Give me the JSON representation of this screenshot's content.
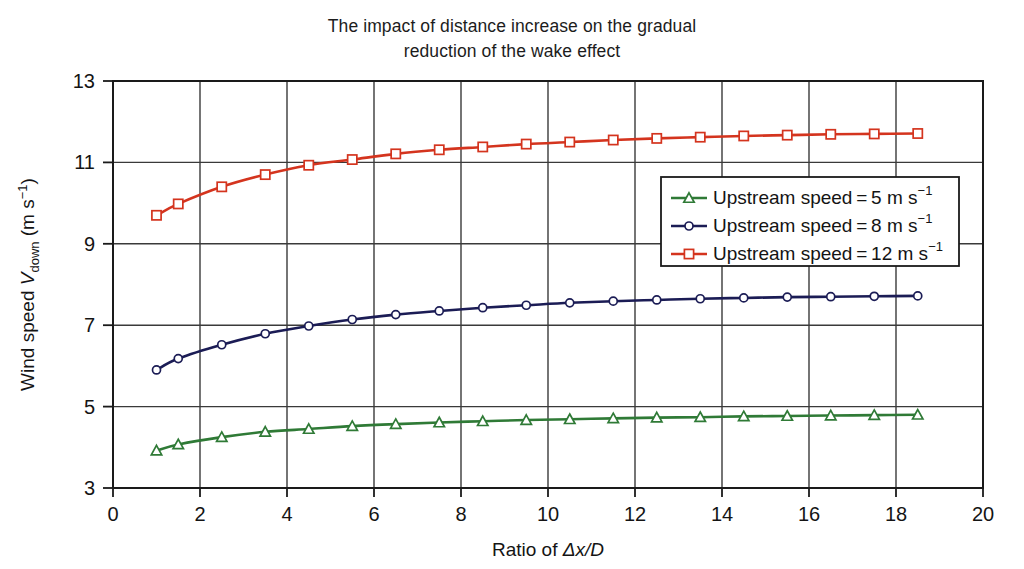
{
  "title": {
    "line1": "The impact of distance increase on the gradual",
    "line2": "reduction of the wake effect"
  },
  "axes": {
    "x_label_prefix": "Ratio of ",
    "x_label_symbol": "Δx/D",
    "y_label_prefix": "Wind speed ",
    "y_label_symbol": "V",
    "y_label_subscript": "down",
    "y_label_units_open": " (m s",
    "y_label_units_sup": "−1",
    "y_label_units_close": ")",
    "x_ticks": [
      "0",
      "2",
      "4",
      "6",
      "8",
      "10",
      "12",
      "14",
      "16",
      "18",
      "20"
    ],
    "y_ticks": [
      "3",
      "5",
      "7",
      "9",
      "11",
      "13"
    ]
  },
  "legend": {
    "position": "inside-right",
    "entries": [
      {
        "label": "Upstream speed = 5 m s",
        "sup": "−1",
        "color": "#2f7a36",
        "marker": "triangle"
      },
      {
        "label": "Upstream speed = 8 m s",
        "sup": "−1",
        "color": "#1b1c55",
        "marker": "diamond"
      },
      {
        "label": "Upstream speed = 12 m s",
        "sup": "−1",
        "color": "#d4341e",
        "marker": "square"
      }
    ]
  },
  "colors": {
    "series_5": "#2f7a36",
    "series_8": "#1b1c55",
    "series_12": "#d4341e",
    "grid": "#3a3a3a",
    "axis": "#1a1a1a",
    "background": "#ffffff"
  },
  "chart_data": {
    "type": "line",
    "title": "The impact of distance increase on the gradual reduction of the wake effect",
    "xlabel": "Ratio of Δx/D",
    "ylabel": "Wind speed V_down (m s−1)",
    "xlim": [
      0,
      20
    ],
    "ylim": [
      3,
      13
    ],
    "xticks": [
      0,
      2,
      4,
      6,
      8,
      10,
      12,
      14,
      16,
      18,
      20
    ],
    "yticks": [
      3,
      5,
      7,
      9,
      11,
      13
    ],
    "grid": true,
    "legend_position": "center right",
    "x": [
      1,
      1.5,
      2.5,
      3.5,
      4.5,
      5.5,
      6.5,
      7.5,
      8.5,
      9.5,
      10.5,
      11.5,
      12.5,
      13.5,
      14.5,
      15.5,
      16.5,
      17.5,
      18.5
    ],
    "series": [
      {
        "name": "Upstream speed = 5 m s-1",
        "color": "#2f7a36",
        "marker": "triangle",
        "values": [
          3.92,
          4.07,
          4.25,
          4.38,
          4.45,
          4.52,
          4.57,
          4.61,
          4.64,
          4.67,
          4.69,
          4.71,
          4.73,
          4.74,
          4.76,
          4.77,
          4.78,
          4.79,
          4.8
        ]
      },
      {
        "name": "Upstream speed = 8 m s-1",
        "color": "#1b1c55",
        "marker": "diamond",
        "values": [
          5.9,
          6.18,
          6.52,
          6.79,
          6.98,
          7.14,
          7.26,
          7.35,
          7.43,
          7.49,
          7.55,
          7.59,
          7.62,
          7.65,
          7.67,
          7.69,
          7.7,
          7.71,
          7.72
        ]
      },
      {
        "name": "Upstream speed = 12 m s-1",
        "color": "#d4341e",
        "marker": "square",
        "values": [
          9.7,
          9.98,
          10.4,
          10.7,
          10.93,
          11.07,
          11.21,
          11.31,
          11.38,
          11.45,
          11.5,
          11.55,
          11.59,
          11.62,
          11.65,
          11.67,
          11.69,
          11.7,
          11.71
        ]
      }
    ]
  }
}
